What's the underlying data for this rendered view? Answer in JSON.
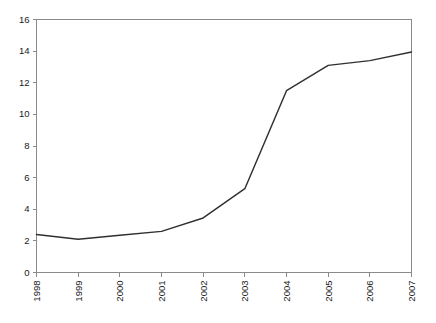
{
  "chart_data": {
    "type": "line",
    "title": "",
    "subtitle": "",
    "xlabel": "",
    "ylabel": "",
    "categories": [
      "1998",
      "1999",
      "2000",
      "2001",
      "2002",
      "2003",
      "2004",
      "2005",
      "2006",
      "2007"
    ],
    "x": [
      1998,
      1999,
      2000,
      2001,
      2002,
      2003,
      2004,
      2005,
      2006,
      2007
    ],
    "values": [
      2.4,
      2.1,
      2.35,
      2.6,
      3.45,
      5.3,
      11.5,
      13.1,
      13.4,
      13.95
    ],
    "series": [
      {
        "name": "",
        "values": [
          2.4,
          2.1,
          2.35,
          2.6,
          3.45,
          5.3,
          11.5,
          13.1,
          13.4,
          13.95
        ]
      }
    ],
    "ylim": [
      0,
      16
    ],
    "xlim": [
      1998,
      2007
    ],
    "ytick_labels": [
      "0",
      "2",
      "4",
      "6",
      "8",
      "10",
      "12",
      "14",
      "16"
    ],
    "ytick_values": [
      0,
      2,
      4,
      6,
      8,
      10,
      12,
      14,
      16
    ],
    "xtick_labels": [
      "1998",
      "1999",
      "2000",
      "2001",
      "2002",
      "2003",
      "2004",
      "2005",
      "2006",
      "2007"
    ],
    "xtick_rotation": 90,
    "grid": false,
    "legend": false,
    "legend_position": "none",
    "line_color": "#303030",
    "axis_color": "#8a8a8a",
    "background_color": "#ffffff",
    "annotations": []
  }
}
